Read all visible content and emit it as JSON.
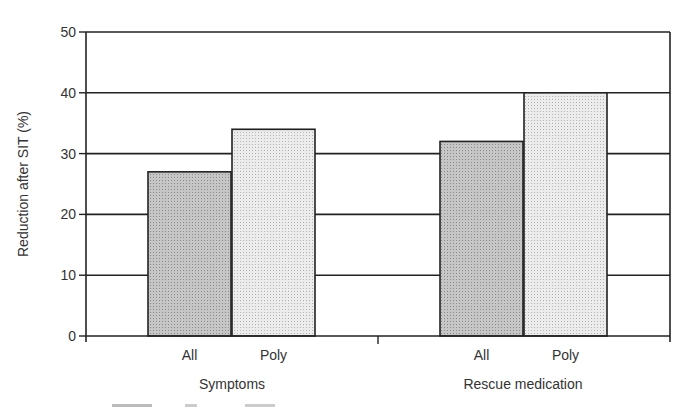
{
  "chart_data": {
    "type": "bar",
    "title": "",
    "xlabel": "",
    "ylabel": "Reduction after SIT (%)",
    "ylim": [
      0,
      50
    ],
    "yticks": [
      0,
      10,
      20,
      30,
      40,
      50
    ],
    "grid": true,
    "groups": [
      {
        "name": "Symptoms",
        "bars": [
          {
            "label": "All",
            "value": 27
          },
          {
            "label": "Poly",
            "value": 34
          }
        ]
      },
      {
        "name": "Rescue medication",
        "bars": [
          {
            "label": "All",
            "value": 32
          },
          {
            "label": "Poly",
            "value": 40
          }
        ]
      }
    ],
    "categories": [
      "Symptoms",
      "Rescue medication"
    ],
    "series": [
      {
        "name": "All",
        "values": [
          27,
          32
        ],
        "color": "#b8b8b8"
      },
      {
        "name": "Poly",
        "values": [
          34,
          40
        ],
        "color": "#e2e2e2"
      }
    ],
    "legend": "none"
  }
}
